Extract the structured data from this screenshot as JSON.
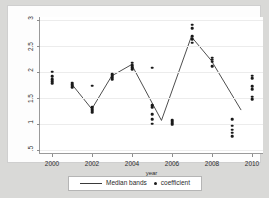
{
  "chart_data": {
    "type": "scatter",
    "title": "",
    "xlabel": "year",
    "ylabel": "",
    "xlim": [
      1999.4,
      2010.6
    ],
    "ylim": [
      0.42,
      3.05
    ],
    "grid": true,
    "legend_position": "bottom-center",
    "yticks": [
      {
        "value": 3,
        "label": "3"
      },
      {
        "value": 2.5,
        "label": "2.5"
      },
      {
        "value": 2,
        "label": "2"
      },
      {
        "value": 1.5,
        "label": "1.5"
      },
      {
        "value": 1,
        "label": "1"
      },
      {
        "value": 0.5,
        "label": ".5"
      }
    ],
    "xticks": [
      {
        "value": 2000,
        "label": "2000"
      },
      {
        "value": 2002,
        "label": "2002"
      },
      {
        "value": 2004,
        "label": "2004"
      },
      {
        "value": 2006,
        "label": "2006"
      },
      {
        "value": 2008,
        "label": "2008"
      },
      {
        "value": 2010,
        "label": "2010"
      }
    ],
    "series": [
      {
        "name": "coefficient",
        "type": "scatter",
        "marker": "circle",
        "color": "#1a1a1a",
        "points": [
          {
            "x": 2000,
            "y": 2.0
          },
          {
            "x": 2000,
            "y": 1.91
          },
          {
            "x": 2000,
            "y": 1.86
          },
          {
            "x": 2000,
            "y": 1.82
          },
          {
            "x": 2000,
            "y": 1.78
          },
          {
            "x": 2001,
            "y": 1.79
          },
          {
            "x": 2001,
            "y": 1.76
          },
          {
            "x": 2001,
            "y": 1.73
          },
          {
            "x": 2001,
            "y": 1.7
          },
          {
            "x": 2002,
            "y": 1.73
          },
          {
            "x": 2002,
            "y": 1.32
          },
          {
            "x": 2002,
            "y": 1.28
          },
          {
            "x": 2002,
            "y": 1.25
          },
          {
            "x": 2002,
            "y": 1.22
          },
          {
            "x": 2003,
            "y": 1.95
          },
          {
            "x": 2003,
            "y": 1.92
          },
          {
            "x": 2003,
            "y": 1.89
          },
          {
            "x": 2003,
            "y": 1.86
          },
          {
            "x": 2004,
            "y": 2.17
          },
          {
            "x": 2004,
            "y": 2.13
          },
          {
            "x": 2004,
            "y": 2.09
          },
          {
            "x": 2004,
            "y": 2.05
          },
          {
            "x": 2005,
            "y": 2.08
          },
          {
            "x": 2005,
            "y": 1.36
          },
          {
            "x": 2005,
            "y": 1.32
          },
          {
            "x": 2005,
            "y": 1.18
          },
          {
            "x": 2005,
            "y": 1.09
          },
          {
            "x": 2005,
            "y": 1.0
          },
          {
            "x": 2006,
            "y": 1.07
          },
          {
            "x": 2006,
            "y": 1.04
          },
          {
            "x": 2006,
            "y": 1.01
          },
          {
            "x": 2006,
            "y": 0.98
          },
          {
            "x": 2007,
            "y": 2.9
          },
          {
            "x": 2007,
            "y": 2.84
          },
          {
            "x": 2007,
            "y": 2.68
          },
          {
            "x": 2007,
            "y": 2.62
          },
          {
            "x": 2007,
            "y": 2.56
          },
          {
            "x": 2008,
            "y": 2.27
          },
          {
            "x": 2008,
            "y": 2.23
          },
          {
            "x": 2008,
            "y": 2.19
          },
          {
            "x": 2008,
            "y": 2.1
          },
          {
            "x": 2009,
            "y": 1.09
          },
          {
            "x": 2009,
            "y": 0.96
          },
          {
            "x": 2009,
            "y": 0.89
          },
          {
            "x": 2009,
            "y": 0.83
          },
          {
            "x": 2009,
            "y": 0.76
          },
          {
            "x": 2010,
            "y": 1.92
          },
          {
            "x": 2010,
            "y": 1.88
          },
          {
            "x": 2010,
            "y": 1.72
          },
          {
            "x": 2010,
            "y": 1.66
          },
          {
            "x": 2010,
            "y": 1.52
          },
          {
            "x": 2010,
            "y": 1.47
          }
        ]
      },
      {
        "name": "Median bands",
        "type": "line",
        "color": "#3a3a3a",
        "points": [
          {
            "x": 2001,
            "y": 1.75
          },
          {
            "x": 2002,
            "y": 1.27
          },
          {
            "x": 2003,
            "y": 1.91
          },
          {
            "x": 2004,
            "y": 2.13
          },
          {
            "x": 2005.5,
            "y": 1.05
          },
          {
            "x": 2007,
            "y": 2.67
          },
          {
            "x": 2008,
            "y": 2.21
          },
          {
            "x": 2009.5,
            "y": 1.25
          }
        ]
      }
    ],
    "legend": [
      {
        "label": "Median bands",
        "marker": "line"
      },
      {
        "label": "coefficient",
        "marker": "dot"
      }
    ]
  }
}
